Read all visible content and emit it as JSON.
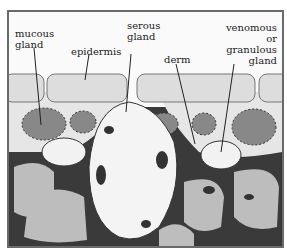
{
  "diagram": {
    "labels": {
      "mucous_gland": [
        "mucous",
        "gland"
      ],
      "epidermis": "epidermis",
      "serous_gland": [
        "serous",
        "gland"
      ],
      "derm": "derm",
      "venomous_gland": [
        "venomous",
        "or granulous",
        "gland"
      ]
    },
    "colors": {
      "frame": "#6a6a6a",
      "dark_tissue": "#3a3a3a",
      "cell_fill": "#bdbdbd",
      "gland_light": "#f0f0f0"
    }
  }
}
